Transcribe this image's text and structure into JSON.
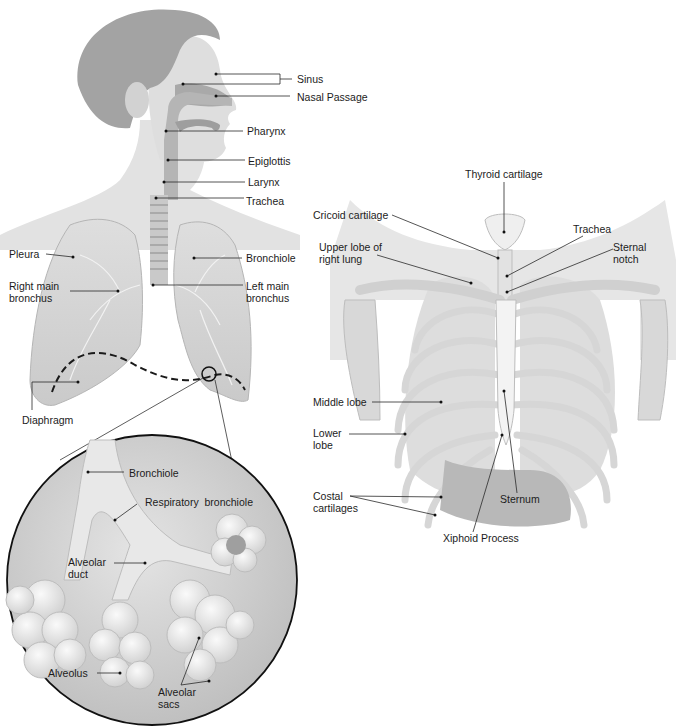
{
  "colors": {
    "background": "#ffffff",
    "skin": "#dcdcdc",
    "hair": "#9a9a9a",
    "lung": "#d2d2d2",
    "lung_edge": "#b8b8b8",
    "bone": "#e6e6e6",
    "bone_shadow": "#bdbdbd",
    "line": "#2a2a2a",
    "diaphragm_dash": "#1a1a1a",
    "circle_fill": "#cfcfcf",
    "alveoli": "#ececec"
  },
  "diagram": {
    "head_and_lungs": {
      "labels": {
        "sinus": "Sinus",
        "nasal_passage": "Nasal Passage",
        "pharynx": "Pharynx",
        "epiglottis": "Epiglottis",
        "larynx": "Larynx",
        "trachea": "Trachea",
        "pleura": "Pleura",
        "bronchiole": "Bronchiole",
        "right_main_bronchus": "Right main bronchus",
        "left_main_bronchus": "Left main bronchus",
        "diaphragm": "Diaphragm"
      }
    },
    "magnified_alveoli": {
      "labels": {
        "bronchiole": "Bronchiole",
        "respiratory_bronchiole": "Respiratory  bronchiole",
        "alveolar_duct": "Alveolar duct",
        "alveolus": "Alveolus",
        "alveolar_sacs": "Alveolar sacs"
      }
    },
    "thorax": {
      "labels": {
        "thyroid_cartilage": "Thyroid cartilage",
        "cricoid_cartilage": "Cricoid cartilage",
        "trachea": "Trachea",
        "upper_lobe_right_lung": "Upper lobe of right lung",
        "sternal_notch": "Sternal notch",
        "middle_lobe": "Middle lobe",
        "lower_lobe": "Lower lobe",
        "costal_cartilages": "Costal cartilages",
        "sternum": "Sternum",
        "xiphoid_process": "Xiphoid Process"
      }
    }
  }
}
